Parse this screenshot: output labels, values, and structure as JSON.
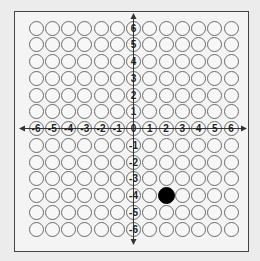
{
  "grid": {
    "x_min": -6,
    "x_max": 6,
    "y_min": -6,
    "y_max": 6,
    "origin_px": {
      "x": 133.5,
      "y": 128.5
    },
    "spacing_px": {
      "x": 16.25,
      "y": 16.75
    },
    "x_axis_labels": [
      "-6",
      "-5",
      "-4",
      "-3",
      "-2",
      "-1",
      "0",
      "1",
      "2",
      "3",
      "4",
      "5",
      "6"
    ],
    "y_axis_labels": [
      "6",
      "5",
      "4",
      "3",
      "2",
      "1",
      "-1",
      "-2",
      "-3",
      "-4",
      "-5",
      "-6"
    ],
    "filled_points": [
      {
        "x": 2,
        "y": -4
      }
    ],
    "colors": {
      "outline": "#6a6a6a",
      "fill": "#000000",
      "frame": "#444444",
      "background": "#ececec"
    }
  }
}
